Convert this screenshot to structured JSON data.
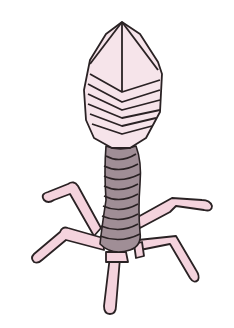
{
  "image": {
    "subject": "Bacteriophage illustration",
    "description": "Cartoon drawing of a T4-like bacteriophage with icosahedral head, contractile sheath tail and six tail fibers",
    "colors": {
      "background": "#ffffff",
      "head_fill": "#f6e4ea",
      "leg_fill": "#f4d3dd",
      "tail_fill": "#a08e96",
      "tail_dark": "#8a7880",
      "outline": "#2a2224"
    },
    "parts": {
      "head": "Capsid (head)",
      "tail": "Tail sheath",
      "fibers": "Tail fibers",
      "baseplate": "Baseplate"
    }
  }
}
